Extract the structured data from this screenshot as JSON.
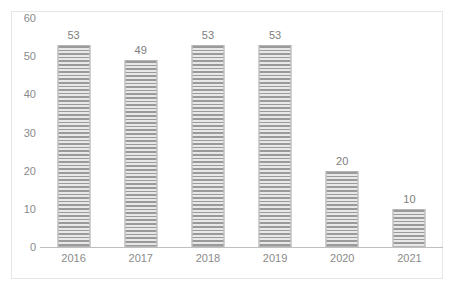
{
  "chart_data": {
    "type": "bar",
    "title": "",
    "subtitle": "",
    "xlabel": "",
    "ylabel": "",
    "categories": [
      "2016",
      "2017",
      "2018",
      "2019",
      "2020",
      "2021"
    ],
    "values": [
      53,
      49,
      53,
      53,
      20,
      10
    ],
    "data_labels": [
      "53",
      "49",
      "53",
      "53",
      "20",
      "10"
    ],
    "series": [
      {
        "name": "",
        "values": [
          53,
          49,
          53,
          53,
          20,
          10
        ]
      }
    ],
    "ylim": [
      0,
      60
    ],
    "ytick_labels": [
      "0",
      "10",
      "20",
      "30",
      "40",
      "50",
      "60"
    ],
    "ytick_values": [
      0,
      10,
      20,
      30,
      40,
      50,
      60
    ],
    "grid": false,
    "legend": false,
    "legend_position": "none",
    "bar_fill": "horizontal-stripe-hatch",
    "colors": {
      "bar_dark": "#9a9a9a",
      "bar_light": "#e8e8e8",
      "bar_border": "#b5b5b5",
      "axis_line": "#bfbfbf",
      "tick_text": "#8a8a8a",
      "label_text": "#7d7d7d",
      "frame_border": "#e6e6e6",
      "background": "#ffffff"
    }
  }
}
